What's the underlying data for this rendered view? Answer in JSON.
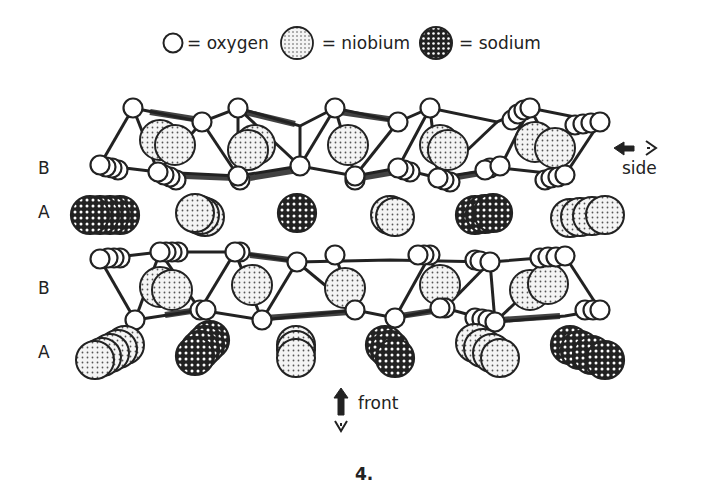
{
  "legend": {
    "items": [
      {
        "symbol": "open-circle",
        "label": "= oxygen"
      },
      {
        "symbol": "dotted-circle",
        "label": "= niobium"
      },
      {
        "symbol": "crosshatched-circle",
        "label": "= sodium"
      }
    ]
  },
  "layers": {
    "labels": [
      {
        "text": "B",
        "row": 1
      },
      {
        "text": "A",
        "row": 2
      },
      {
        "text": "B",
        "row": 3
      },
      {
        "text": "A",
        "row": 4
      }
    ]
  },
  "views": {
    "side": {
      "label": "side",
      "icon": "left-arrow-eye-icon"
    },
    "front": {
      "label": "front",
      "icon": "up-arrow-eye-icon"
    }
  },
  "figure": {
    "number": "4."
  },
  "colors": {
    "ink": "#222222",
    "background": "#ffffff",
    "niobium_fill": "#e8e8e8",
    "sodium_fill": "#2a2a2a"
  }
}
